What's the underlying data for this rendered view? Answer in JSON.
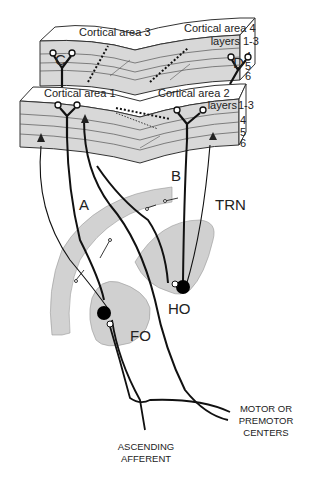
{
  "colors": {
    "cortex_fill": "#d8d8d8",
    "cortex_top": "#ffffff",
    "nucleus_fill": "#d0d0d0",
    "line": "#1a1a1a",
    "background": "#ffffff"
  },
  "cortex_upper": {
    "areas": [
      "Cortical area 3",
      "Cortical area 4"
    ],
    "layer_labels": [
      "layers",
      "1-3",
      "4",
      "5",
      "6"
    ],
    "neuron_labels": [
      "C",
      "D"
    ]
  },
  "cortex_lower": {
    "areas": [
      "Cortical area 1",
      "Cortical area 2"
    ],
    "layer_labels": [
      "layers",
      "1-3",
      "4",
      "5",
      "6"
    ]
  },
  "pathway_labels": [
    "A",
    "B"
  ],
  "nuclei": {
    "trn": "TRN",
    "ho": "HO",
    "fo": "FO"
  },
  "captions": {
    "motor": [
      "MOTOR OR",
      "PREMOTOR",
      "CENTERS"
    ],
    "afferent": [
      "ASCENDING",
      "AFFERENT"
    ]
  }
}
